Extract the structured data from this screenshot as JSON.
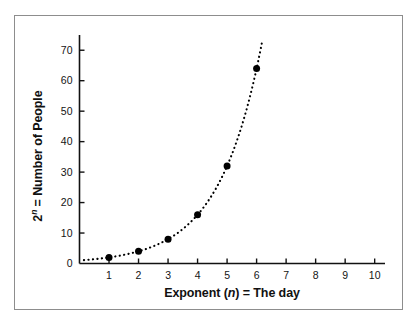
{
  "figure": {
    "name": "exponential-growth-plot",
    "background_color": "#ffffff",
    "frame_color": "#8d8d8d",
    "ink_color": "#111111"
  },
  "chart_data": {
    "type": "scatter",
    "title": "",
    "subtitle": "",
    "xlabel_parts": {
      "pre": "Exponent (",
      "italic": "n",
      "post": ") = The day"
    },
    "xlabel": "Exponent (n) = The day",
    "ylabel_parts": {
      "base": "2",
      "sup": "n",
      "post": " = Number of People"
    },
    "ylabel": "2n = Number of People",
    "x": [
      1,
      2,
      3,
      4,
      5,
      6
    ],
    "values": [
      2,
      4,
      8,
      16,
      32,
      64
    ],
    "series": [
      {
        "name": "2^n",
        "x": [
          1,
          2,
          3,
          4,
          5,
          6
        ],
        "values": [
          2,
          4,
          8,
          16,
          32,
          64
        ],
        "marker": "filled-circle",
        "marker_color": "#000000",
        "line_style": "dotted",
        "line_color": "#000000"
      }
    ],
    "fit_curve": {
      "equation": "y = 2^x",
      "x_start": 0.15,
      "x_end": 6.2,
      "style": "dotted"
    },
    "xlim": [
      0,
      10.35
    ],
    "ylim": [
      0,
      75
    ],
    "xticks": [
      1,
      2,
      3,
      4,
      5,
      6,
      7,
      8,
      9,
      10
    ],
    "xticklabels": [
      "1",
      "2",
      "3",
      "4",
      "5",
      "6",
      "7",
      "8",
      "9",
      "10"
    ],
    "yticks": [
      0,
      10,
      20,
      30,
      40,
      50,
      60,
      70
    ],
    "yticklabels": [
      "0",
      "10",
      "20",
      "30",
      "40",
      "50",
      "60",
      "70"
    ],
    "grid": false,
    "legend": null,
    "legend_position": "none",
    "annotations": []
  }
}
